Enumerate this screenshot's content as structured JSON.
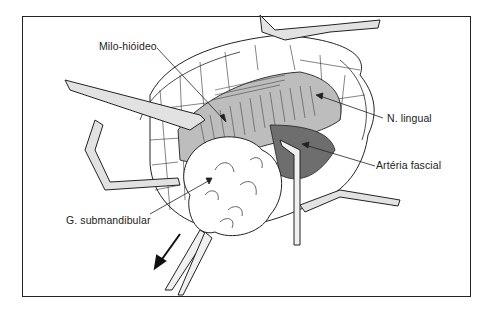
{
  "figure": {
    "labels": {
      "mylohyoid": "Milo-hióideo",
      "lingual_nerve": "N. lingual",
      "facial_artery": "Artéria fascial",
      "submandibular_gland": "G. submandibular"
    },
    "colors": {
      "line": "#222222",
      "shading": "#7a7a7a",
      "retractor_fill": "#d9d9d9",
      "background": "#ffffff"
    }
  }
}
